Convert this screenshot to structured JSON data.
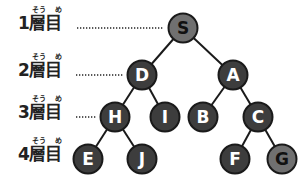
{
  "levels": [
    {
      "label": "1層目",
      "furigana_sou": "そう",
      "furigana_me": "め",
      "y": 28,
      "dots_from": 77,
      "dots_to": 163
    },
    {
      "label": "2層目",
      "furigana_sou": "そう",
      "furigana_me": "め",
      "y": 75,
      "dots_from": 76,
      "dots_to": 124
    },
    {
      "label": "3層目",
      "furigana_sou": "そう",
      "furigana_me": "め",
      "y": 117,
      "dots_from": 76,
      "dots_to": 96
    },
    {
      "label": "4層目",
      "furigana_sou": "そう",
      "furigana_me": "め",
      "y": 159,
      "dots_from": null,
      "dots_to": null
    }
  ],
  "colors": {
    "node_dark": "#3d3d3d",
    "node_light": "#707070",
    "stroke": "#1a1a1a",
    "text_light": "#ffffff",
    "text_dark": "#111111",
    "edge": "#1a1a1a"
  },
  "nodes": [
    {
      "id": "S",
      "label": "S",
      "x": 183,
      "y": 28,
      "style": "light"
    },
    {
      "id": "D",
      "label": "D",
      "x": 142,
      "y": 75,
      "style": "dark"
    },
    {
      "id": "A",
      "label": "A",
      "x": 233,
      "y": 75,
      "style": "dark"
    },
    {
      "id": "H",
      "label": "H",
      "x": 115,
      "y": 117,
      "style": "dark"
    },
    {
      "id": "I",
      "label": "I",
      "x": 165,
      "y": 117,
      "style": "dark"
    },
    {
      "id": "B",
      "label": "B",
      "x": 203,
      "y": 117,
      "style": "dark"
    },
    {
      "id": "C",
      "label": "C",
      "x": 258,
      "y": 117,
      "style": "dark"
    },
    {
      "id": "E",
      "label": "E",
      "x": 88,
      "y": 159,
      "style": "dark"
    },
    {
      "id": "J",
      "label": "J",
      "x": 142,
      "y": 159,
      "style": "dark"
    },
    {
      "id": "F",
      "label": "F",
      "x": 235,
      "y": 159,
      "style": "dark"
    },
    {
      "id": "G",
      "label": "G",
      "x": 282,
      "y": 159,
      "style": "light"
    }
  ],
  "edges": [
    [
      "S",
      "D"
    ],
    [
      "S",
      "A"
    ],
    [
      "D",
      "H"
    ],
    [
      "D",
      "I"
    ],
    [
      "A",
      "B"
    ],
    [
      "A",
      "C"
    ],
    [
      "H",
      "E"
    ],
    [
      "H",
      "J"
    ],
    [
      "C",
      "F"
    ],
    [
      "C",
      "G"
    ]
  ]
}
